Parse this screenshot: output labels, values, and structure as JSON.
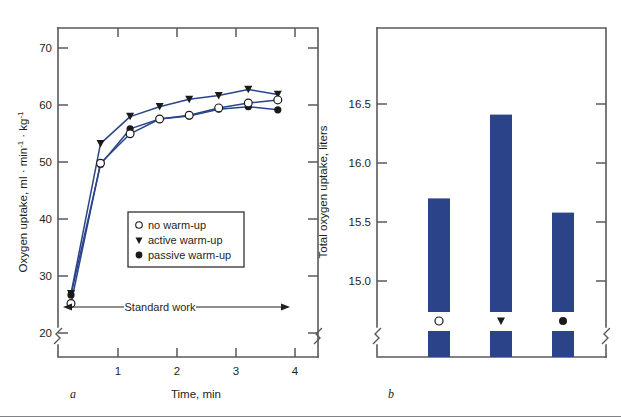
{
  "figure": {
    "panel_a_label": "a",
    "panel_b_label": "b"
  },
  "chart_data": [
    {
      "id": "panel-a",
      "type": "line",
      "title": "",
      "xlabel": "Time, min",
      "ylabel_main": "Oxygen uptake, ml · min",
      "ylabel_sup1": "-1",
      "ylabel_mid": " · kg",
      "ylabel_sup2": "-1",
      "ylabel_full": "Oxygen uptake, ml · min-1 · kg-1",
      "xlim": [
        0,
        4.4
      ],
      "ylim": [
        18.5,
        72
      ],
      "xticks": [
        1,
        2,
        3,
        4
      ],
      "xticklabels": [
        "1",
        "2",
        "3",
        "4"
      ],
      "yticks": [
        20,
        30,
        40,
        50,
        60,
        70
      ],
      "yticklabels": [
        "20",
        "30",
        "40",
        "50",
        "60",
        "70"
      ],
      "grid": false,
      "axis_break": true,
      "legend_position": "inside-center-left",
      "annotation": {
        "text": "Standard work",
        "x_start": 0.18,
        "x_end": 3.8,
        "y": 24.6,
        "style": "double-arrow"
      },
      "series": [
        {
          "name": "no warm-up",
          "marker": "open-circle",
          "color": "#2b4489",
          "x": [
            0.22,
            0.72,
            1.22,
            1.72,
            2.22,
            2.72,
            3.22,
            3.72
          ],
          "values": [
            27.2,
            50.0,
            54.8,
            57.2,
            57.8,
            59.0,
            59.8,
            60.3
          ]
        },
        {
          "name": "active warm-up",
          "marker": "filled-triangle-down",
          "color": "#2b4489",
          "x": [
            0.22,
            0.72,
            1.22,
            1.72,
            2.22,
            2.72,
            3.22,
            3.72
          ],
          "values": [
            28.8,
            53.2,
            57.6,
            59.2,
            60.4,
            61.0,
            62.0,
            61.2
          ]
        },
        {
          "name": "passive warm-up",
          "marker": "filled-circle",
          "color": "#2b4489",
          "x": [
            0.22,
            0.72,
            1.22,
            1.72,
            2.22,
            2.72,
            3.22,
            3.72
          ],
          "values": [
            28.6,
            49.8,
            55.6,
            57.2,
            57.7,
            58.8,
            59.2,
            58.7
          ]
        }
      ],
      "legend_entries": [
        {
          "marker": "open-circle",
          "label": "no warm-up"
        },
        {
          "marker": "filled-triangle-down",
          "label": "active warm-up"
        },
        {
          "marker": "filled-circle",
          "label": "passive warm-up"
        }
      ]
    },
    {
      "id": "panel-b",
      "type": "bar",
      "title": "",
      "xlabel": "",
      "ylabel": "Total oxygen uptake, liters",
      "ylim": [
        14.78,
        17.02
      ],
      "yticks": [
        15.0,
        15.5,
        16.0,
        16.5
      ],
      "yticklabels": [
        "15.0",
        "15.5",
        "16.0",
        "16.5"
      ],
      "grid": false,
      "axis_break": true,
      "bar_color": "#2b4489",
      "categories": [
        "no warm-up",
        "active warm-up",
        "passive warm-up"
      ],
      "category_markers": [
        "open-circle",
        "filled-triangle-down",
        "filled-circle"
      ],
      "values": [
        15.7,
        16.41,
        15.58
      ]
    }
  ]
}
